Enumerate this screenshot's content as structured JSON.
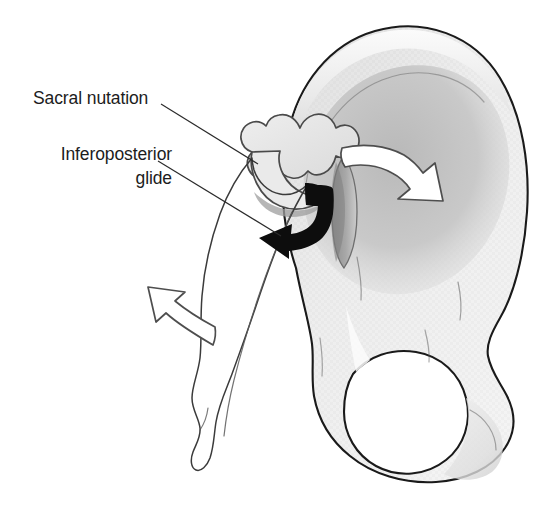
{
  "figure": {
    "background_color": "#ffffff",
    "width": 555,
    "height": 522
  },
  "labels": [
    {
      "id": "sacral-nutation",
      "text": "Sacral nutation",
      "lines": [
        "Sacral nutation"
      ],
      "align": "left",
      "x": 33,
      "y": 104,
      "leader": {
        "x1": 161,
        "y1": 104,
        "x2": 258,
        "y2": 164
      }
    },
    {
      "id": "inferoposterior-glide",
      "text": "Inferoposterior glide",
      "lines": [
        "Inferoposterior",
        "glide"
      ],
      "align": "right",
      "x": 172,
      "y": 160,
      "line_height": 24,
      "leader": {
        "x1": 158,
        "y1": 161,
        "x2": 281,
        "y2": 236
      }
    }
  ],
  "arrows": [
    {
      "id": "inferoposterior-glide-arrow",
      "style": "solid-black",
      "color": "#0d0d0d",
      "description": "Curved black arrow descending then sweeping inferiorly and posteriorly to the left",
      "direction": "inferoposterior"
    },
    {
      "id": "sacral-nutation-arrow",
      "style": "outline-white",
      "color": "#ffffff",
      "outline_color": "#4e4e4e",
      "description": "Curved white outlined arrow sweeping to the right across the iliac fossa",
      "direction": "anterior-inferior"
    },
    {
      "id": "coccyx-counter-arrow",
      "style": "outline-white",
      "color": "#ffffff",
      "outline_color": "#4e4e4e",
      "description": "Curved white outlined arrow pointing superiorly and to the left below the sacrum",
      "direction": "superior-posterior"
    }
  ],
  "anatomy": [
    {
      "id": "ilium",
      "name": "Ilium",
      "fill": "#f0f0f0"
    },
    {
      "id": "iliac-fossa",
      "name": "Iliac fossa",
      "fill": "#c5c5c5"
    },
    {
      "id": "iliac-crest",
      "name": "Iliac crest",
      "fill": "#e6e6e6"
    },
    {
      "id": "auricular-surface",
      "name": "Auricular surface",
      "fill": "#e4e4e4"
    },
    {
      "id": "sacroiliac-joint",
      "name": "Sacroiliac joint surface",
      "fill": "#9a9a9a"
    },
    {
      "id": "sacrum",
      "name": "Sacrum and coccyx",
      "fill": "#ffffff"
    },
    {
      "id": "obturator-foramen",
      "name": "Obturator foramen",
      "fill": "#ffffff"
    },
    {
      "id": "ischium",
      "name": "Ischium",
      "fill": "#e8e8e8"
    }
  ],
  "colors": {
    "outline": "#1a1a1a",
    "bone_light": "#f0f0f0",
    "bone_mid": "#d8d8d8",
    "bone_shadow": "#c5c5c5",
    "joint_dark": "#9a9a9a",
    "text": "#1c1c1c",
    "leader": "#2b2b2b"
  }
}
